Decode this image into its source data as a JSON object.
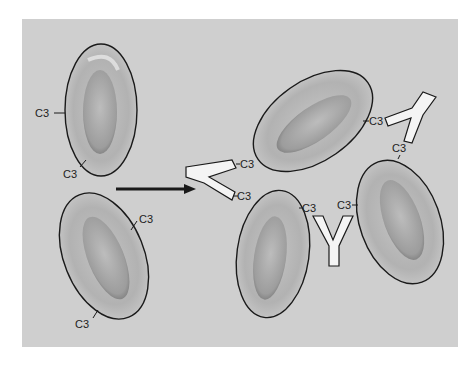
{
  "figure": {
    "panel_color": "#cfcfcf",
    "cell_fill": "#bdbdbd",
    "cell_stroke": "#1a1a1a",
    "antibody_fill": "#f4f4f4",
    "label_text": "C3"
  },
  "left_cells": [
    {
      "id": "cell-1",
      "labels": [
        "C3",
        "C3"
      ]
    },
    {
      "id": "cell-2",
      "labels": [
        "C3",
        "C3"
      ]
    }
  ],
  "arrow": {
    "direction": "right"
  },
  "right_cluster": {
    "cells": [
      {
        "id": "cell-top",
        "labels": [
          "C3",
          "C3"
        ]
      },
      {
        "id": "cell-bottom-left",
        "labels": [
          "C3",
          "C3"
        ]
      },
      {
        "id": "cell-right",
        "labels": [
          "C3",
          "C3"
        ]
      }
    ],
    "antibodies": [
      {
        "id": "antibody-left",
        "labels": [
          "C3",
          "C3"
        ]
      },
      {
        "id": "antibody-middle",
        "labels": [
          "C3",
          "C3"
        ]
      },
      {
        "id": "antibody-top-right",
        "labels": [
          "C3",
          "C3"
        ]
      }
    ]
  }
}
